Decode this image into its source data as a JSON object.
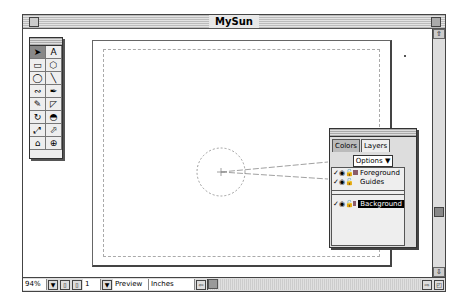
{
  "window": {
    "title": "MySun"
  },
  "toolbox": {
    "tools": [
      {
        "name": "pointer-tool",
        "glyph": "➤",
        "active": true
      },
      {
        "name": "text-tool",
        "glyph": "A"
      },
      {
        "name": "rectangle-tool",
        "glyph": "▭"
      },
      {
        "name": "polygon-tool",
        "glyph": "⬡"
      },
      {
        "name": "ellipse-tool",
        "glyph": "◯"
      },
      {
        "name": "line-tool",
        "glyph": "╲"
      },
      {
        "name": "freehand-tool",
        "glyph": "∾"
      },
      {
        "name": "pen-tool",
        "glyph": "✒"
      },
      {
        "name": "knife-tool",
        "glyph": "✎"
      },
      {
        "name": "bezigon-tool",
        "glyph": "◸"
      },
      {
        "name": "rotate-tool",
        "glyph": "↻"
      },
      {
        "name": "reflect-tool",
        "glyph": "◓"
      },
      {
        "name": "scale-tool",
        "glyph": "⤢"
      },
      {
        "name": "skew-tool",
        "glyph": "⬀"
      },
      {
        "name": "trace-tool",
        "glyph": "⌂"
      },
      {
        "name": "zoom-tool",
        "glyph": "⊕"
      }
    ]
  },
  "layers_panel": {
    "tabs": [
      {
        "label": "Colors",
        "active": false
      },
      {
        "label": "Layers",
        "active": true
      }
    ],
    "options_label": "Options",
    "options_arrow": "▼",
    "layers": [
      {
        "name": "Foreground",
        "check": "✓",
        "selected": false,
        "swatch": true
      },
      {
        "name": "Guides",
        "check": "✓",
        "selected": false,
        "swatch": false
      }
    ],
    "background_layers": [
      {
        "name": "Background",
        "check": "✓",
        "selected": true,
        "swatch": true
      }
    ]
  },
  "statusbar": {
    "zoom": "94%",
    "page_number": "1",
    "view_mode": "Preview",
    "units": "Inches",
    "dropdown_arrow": "▼"
  },
  "colors": {
    "layer_swatch": "#8a5b6a",
    "selection": "#000000"
  }
}
